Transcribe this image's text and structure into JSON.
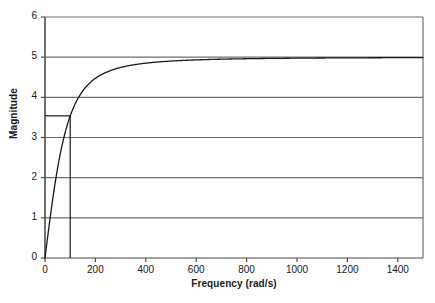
{
  "chart_data": {
    "type": "line",
    "title": "",
    "xlabel": "Frequency (rad/s)",
    "ylabel": "Magnitude",
    "xlim": [
      0,
      1500
    ],
    "ylim": [
      0,
      6
    ],
    "xticks": [
      0,
      200,
      400,
      600,
      800,
      1000,
      1200,
      1400
    ],
    "xtick_labels": [
      "0",
      "200",
      "400",
      "600",
      "800",
      "1000",
      "1200",
      "1400"
    ],
    "yticks": [
      0,
      1,
      2,
      3,
      4,
      5,
      6
    ],
    "ytick_labels": [
      "0",
      "1",
      "2",
      "3",
      "4",
      "5",
      "6"
    ],
    "grid": "horizontal",
    "legend": null,
    "series": [
      {
        "name": "Magnitude response",
        "formula": "5*w/sqrt(w^2 + 100^2)",
        "asymptote": 5,
        "cutoff_frequency": 100,
        "x": [
          0,
          10,
          20,
          30,
          40,
          50,
          60,
          70,
          80,
          90,
          100,
          120,
          140,
          160,
          180,
          200,
          250,
          300,
          350,
          400,
          450,
          500,
          600,
          700,
          800,
          900,
          1000,
          1100,
          1200,
          1300,
          1400,
          1500
        ],
        "y": [
          0.0,
          0.5,
          0.98,
          1.44,
          1.86,
          2.24,
          2.57,
          2.87,
          3.12,
          3.35,
          3.54,
          3.84,
          4.07,
          4.24,
          4.37,
          4.47,
          4.64,
          4.74,
          4.81,
          4.85,
          4.88,
          4.9,
          4.93,
          4.95,
          4.96,
          4.97,
          4.98,
          4.98,
          4.98,
          4.99,
          4.99,
          4.99
        ]
      }
    ],
    "annotations": [
      {
        "name": "cutoff-marker",
        "type": "corner-lines",
        "x": 100,
        "y": 3.54,
        "description": "Horizontal line from y-axis to (100, 3.54) and vertical line from (100, 3.54) down to x-axis"
      }
    ],
    "colors": {
      "curve": "#1a1a1a",
      "grid": "#6e6e6e",
      "axis": "#4d4d4d",
      "text": "#1a1a1a",
      "background": "#ffffff",
      "marker": "#1a1a1a"
    }
  }
}
